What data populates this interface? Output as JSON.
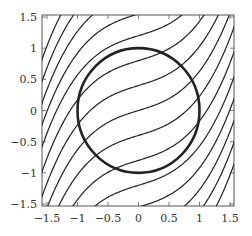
{
  "chart_data": {
    "type": "line",
    "title": "",
    "xlabel": "",
    "ylabel": "",
    "xlim": [
      -1.5,
      1.5
    ],
    "ylim": [
      -1.5,
      1.5
    ],
    "xticks": [
      -1.5,
      -1,
      -0.5,
      0,
      0.5,
      1,
      1.5
    ],
    "yticks": [
      -1.5,
      -1,
      -0.5,
      0,
      0.5,
      1,
      1.5
    ],
    "xtick_labels": [
      "−1.5",
      "−1",
      "−0.5",
      "0",
      "0.5",
      "1",
      "1.5"
    ],
    "ytick_labels": [
      "−1.5",
      "−1",
      "−0.5",
      "0",
      "0.5",
      "1",
      "1.5"
    ],
    "grid": false,
    "legend": "none",
    "circle": {
      "center": [
        0,
        0
      ],
      "radius": 1
    },
    "curve_family": {
      "description": "S-shaped flow lines y = c + 0.3x + 0.33x^3",
      "a1": 0.3,
      "a3": 0.33,
      "offsets": [
        -2.6,
        -2.25,
        -1.9,
        -1.55,
        -1.2,
        -0.8,
        -0.4,
        0,
        0.4,
        0.8,
        1.2,
        1.55,
        1.9,
        2.25,
        2.6
      ]
    },
    "colors": {
      "curves": "#222222",
      "frame": "#555555",
      "text": "#333333"
    }
  }
}
